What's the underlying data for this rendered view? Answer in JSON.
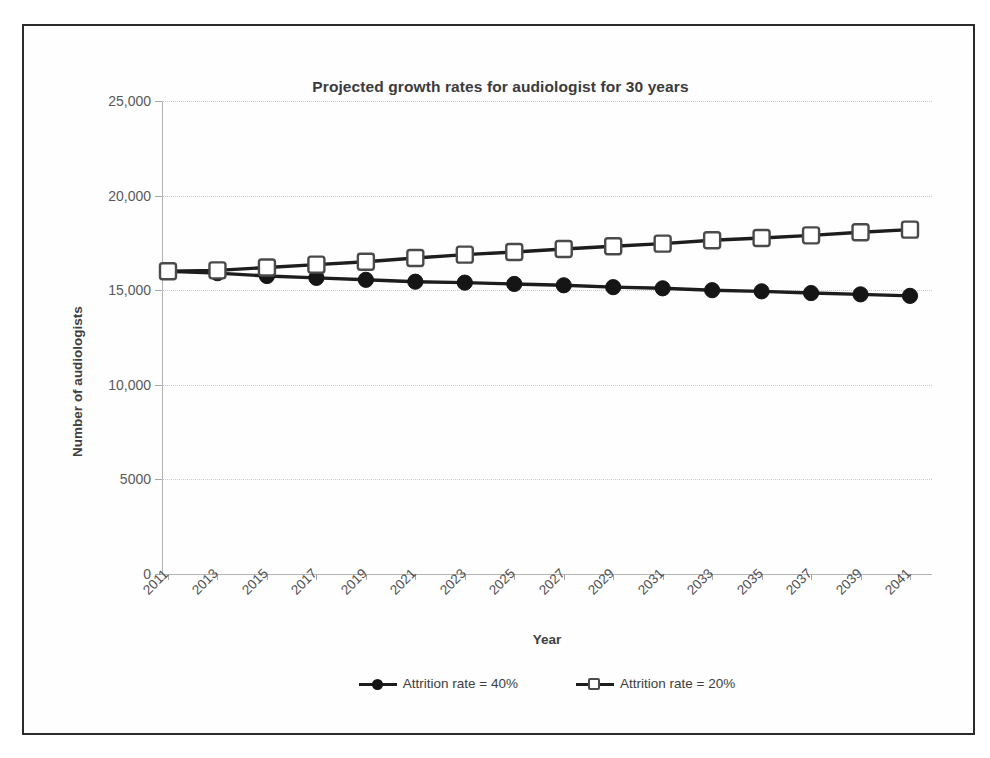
{
  "chart_data": {
    "type": "line",
    "title": "Projected growth rates for audiologist for 30 years",
    "xlabel": "Year",
    "ylabel": "Number of audiologists",
    "grid": true,
    "legend_position": "bottom",
    "xlim": [
      2011,
      2041
    ],
    "ylim": [
      0,
      25000
    ],
    "ytick_labels": [
      "25,000",
      "20,000",
      "15,000",
      "10,000",
      "5000",
      "0"
    ],
    "ytick_values": [
      25000,
      20000,
      15000,
      10000,
      5000,
      0
    ],
    "xtick_labels": [
      "2011",
      "2013",
      "2015",
      "2017",
      "2019",
      "2021",
      "2023",
      "2025",
      "2027",
      "2029",
      "2031",
      "2033",
      "2035",
      "2037",
      "2039",
      "2041"
    ],
    "x": [
      2011,
      2013,
      2015,
      2017,
      2019,
      2021,
      2023,
      2025,
      2027,
      2029,
      2031,
      2033,
      2035,
      2037,
      2039,
      2041
    ],
    "series": [
      {
        "name": "Attrition rate = 40%",
        "marker": "filled-circle",
        "color": "#151515",
        "values": [
          16000,
          15900,
          15750,
          15650,
          15550,
          15450,
          15400,
          15330,
          15260,
          15160,
          15100,
          15000,
          14940,
          14850,
          14780,
          14700
        ]
      },
      {
        "name": "Attrition rate = 20%",
        "marker": "open-square",
        "color": "#4a4a4a",
        "values": [
          16000,
          16050,
          16200,
          16350,
          16500,
          16700,
          16880,
          17020,
          17180,
          17320,
          17460,
          17640,
          17760,
          17900,
          18060,
          18200
        ]
      }
    ]
  },
  "legend": {
    "entries": [
      {
        "label": "Attrition rate = 40%"
      },
      {
        "label": "Attrition rate = 20%"
      }
    ]
  }
}
